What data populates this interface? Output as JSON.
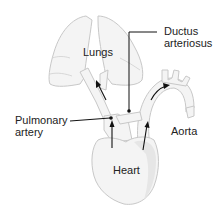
{
  "diagram": {
    "type": "anatomical-illustration",
    "labels": {
      "lungs": "Lungs",
      "ductus_line1": "Ductus",
      "ductus_line2": "arteriosus",
      "pulmonary_line1": "Pulmonary",
      "pulmonary_line2": "artery",
      "aorta": "Aorta",
      "heart": "Heart"
    },
    "structures": [
      "lungs",
      "pulmonary-artery",
      "ductus-arteriosus",
      "aorta",
      "heart"
    ],
    "flow_arrows": [
      {
        "from": "heart",
        "to": "pulmonary-artery"
      },
      {
        "from": "pulmonary-artery",
        "to": "lungs"
      },
      {
        "from": "heart",
        "to": "aorta"
      },
      {
        "from": "aorta",
        "to": "aortic-arch"
      }
    ],
    "colors": {
      "organ_fill": "#f4f4f4",
      "organ_outline": "#c8c8c8",
      "label_text": "#222222",
      "leader_line": "#111111"
    }
  }
}
